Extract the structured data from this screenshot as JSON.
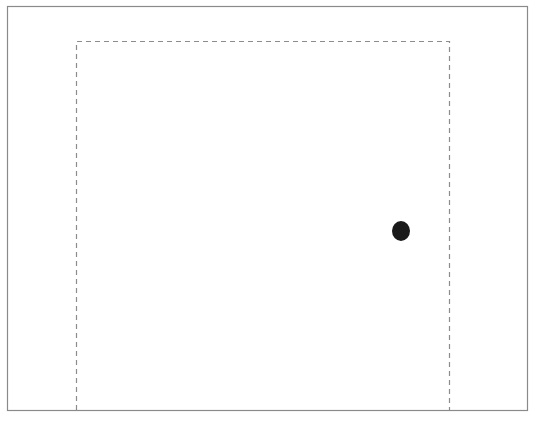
{
  "diagram": {
    "colors": {
      "background": "#ffffff",
      "frame_stroke": "#8a8a8a",
      "door_stroke": "#8c8c8c",
      "knob_fill": "#1a1a1a"
    },
    "frame": {
      "x": 7,
      "y": 6,
      "width": 520,
      "height": 404
    },
    "door_outline": {
      "style": "dashed",
      "left_x": 76,
      "right_x": 449,
      "top_y": 41,
      "bottom_y": 410
    },
    "knob": {
      "cx": 401,
      "cy": 231,
      "rx": 9,
      "ry": 10
    }
  }
}
